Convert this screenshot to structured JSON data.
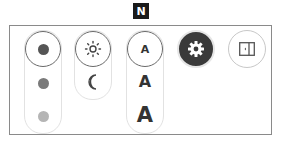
{
  "badge": {
    "label": "N"
  },
  "colors": {
    "panel_border": "#8a8a8a",
    "pill_border": "#e2e2e2",
    "selected_ring": "#6a6a6a",
    "gear_bg": "#3a3a3a"
  },
  "color_group": {
    "items": [
      {
        "name": "dark",
        "color": "#555555",
        "selected": true
      },
      {
        "name": "medium",
        "color": "#7a7a7a",
        "selected": false
      },
      {
        "name": "light",
        "color": "#b5b5b5",
        "selected": false
      }
    ]
  },
  "theme_group": {
    "items": [
      {
        "name": "light-mode",
        "icon": "sun-icon",
        "selected": true
      },
      {
        "name": "dark-mode",
        "icon": "moon-icon",
        "selected": false
      }
    ]
  },
  "font_size_group": {
    "items": [
      {
        "label": "A",
        "size": "small",
        "selected": true
      },
      {
        "label": "A",
        "size": "medium",
        "selected": false
      },
      {
        "label": "A",
        "size": "large",
        "selected": false
      }
    ]
  },
  "settings_button": {
    "icon": "gear-icon"
  },
  "sidebar_button": {
    "icon": "sidebar-toggle-icon"
  }
}
